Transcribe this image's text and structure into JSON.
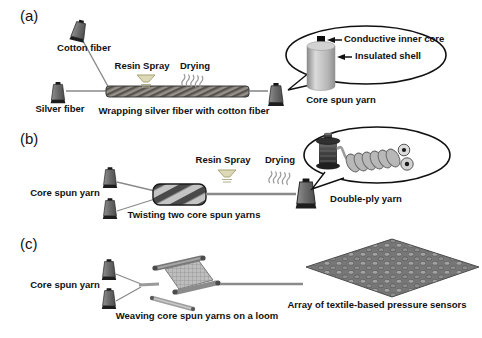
{
  "figure": {
    "type": "process-diagram",
    "background_color": "#ffffff",
    "text_color": "#111111",
    "line_color": "#8a8a8a",
    "panels": {
      "a": {
        "label": "(a)",
        "cotton_fiber_label": "Cotton fiber",
        "silver_fiber_label": "Silver fiber",
        "resin_spray_label": "Resin Spray",
        "drying_label": "Drying",
        "caption": "Wrapping silver fiber with cotton fiber",
        "product_label": "Core spun yarn",
        "callout": {
          "conductive_inner_core_label": "Conductive inner core",
          "insulated_shell_label": "Insulated shell"
        }
      },
      "b": {
        "label": "(b)",
        "input_label": "Core spun yarn",
        "caption": "Twisting two core spun yarns",
        "resin_spray_label": "Resin Spray",
        "drying_label": "Drying",
        "callout": {
          "product_label": "Double-ply yarn"
        }
      },
      "c": {
        "label": "(c)",
        "input_label": "Core spun yarn",
        "caption": "Weaving core spun yarns on a loom",
        "product_label": "Array of textile-based pressure sensors"
      }
    },
    "icon_colors": {
      "bobbin_body": "#6d6d6d",
      "bobbin_cap": "#1d1d1d",
      "wrapped_yarn_dark": "#57544c",
      "wrapped_yarn_light": "#94908a",
      "twisted_yarn_dark": "#494949",
      "twisted_yarn_light": "#c4c4c4",
      "spray_nozzle": "#ddd9b6",
      "steam_gray": "#9a9a9a",
      "fabric_gray": "#8d8d8d"
    }
  }
}
